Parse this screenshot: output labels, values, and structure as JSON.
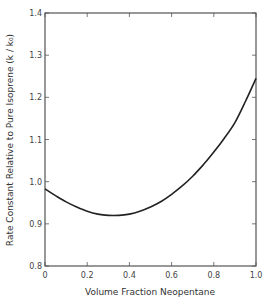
{
  "chart_data": {
    "type": "line",
    "title": "",
    "xlabel": "Volume  Fraction  Neopentane",
    "ylabel": "Rate  Constant  Relative  to  Pure  Isoprene  (k / k₀)",
    "xlim": [
      0,
      1.0
    ],
    "ylim": [
      0.8,
      1.4
    ],
    "x_ticks": [
      "0",
      "0.2",
      "0.4",
      "0.6",
      "0.8",
      "1.0"
    ],
    "y_ticks": [
      "0.8",
      "0.9",
      "1.0",
      "1.1",
      "1.2",
      "1.3",
      "1.4"
    ],
    "grid": false,
    "legend": null,
    "series": [
      {
        "name": "k/k0",
        "x": [
          0.0,
          0.05,
          0.1,
          0.15,
          0.2,
          0.25,
          0.3,
          0.35,
          0.4,
          0.45,
          0.5,
          0.55,
          0.6,
          0.65,
          0.7,
          0.75,
          0.8,
          0.85,
          0.9,
          0.95,
          1.0
        ],
        "values": [
          0.983,
          0.967,
          0.952,
          0.94,
          0.93,
          0.923,
          0.92,
          0.92,
          0.923,
          0.93,
          0.94,
          0.953,
          0.97,
          0.99,
          1.013,
          1.04,
          1.07,
          1.103,
          1.14,
          1.19,
          1.245
        ]
      }
    ]
  },
  "labels": {
    "xlabel": "Volume  Fraction  Neopentane",
    "ylabel": "Rate  Constant  Relative  to  Pure  Isoprene  (k / k₀)"
  }
}
